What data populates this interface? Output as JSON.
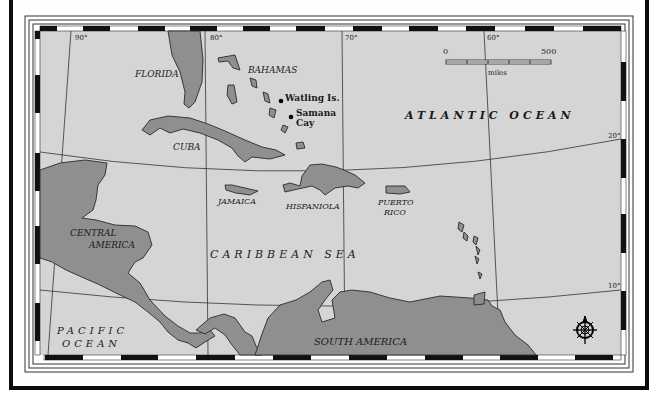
{
  "map": {
    "title": "",
    "land_color": "#8f8f8f",
    "water_color": "#d5d5d5",
    "frame_color": "#0c0c0c",
    "longitude_labels": [
      "90°",
      "80°",
      "70°",
      "60°"
    ],
    "latitude_labels": [
      "20°",
      "10°"
    ],
    "regions": {
      "florida": "FLORIDA",
      "bahamas": "BAHAMAS",
      "cuba": "CUBA",
      "jamaica": "JAMAICA",
      "hispaniola": "HISPANIOLA",
      "puerto_rico_line1": "PUERTO",
      "puerto_rico_line2": "RICO",
      "central_america_line1": "CENTRAL",
      "central_america_line2": "AMERICA",
      "south_america": "SOUTH AMERICA"
    },
    "waters": {
      "atlantic": "ATLANTIC OCEAN",
      "caribbean": "CARIBBEAN SEA",
      "pacific_line1": "PACIFIC",
      "pacific_line2": "OCEAN"
    },
    "points": {
      "watling": "Watling Is.",
      "samana_line1": "Samana",
      "samana_line2": "Cay"
    },
    "scale_bar": {
      "start": "0",
      "end": "500",
      "unit": "miles"
    },
    "compass_icon": "compass-rose-icon"
  }
}
